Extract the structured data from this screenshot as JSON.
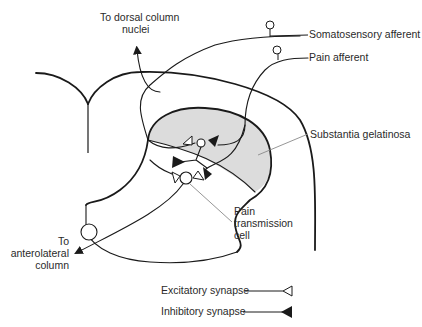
{
  "diagram": {
    "labels": {
      "dorsal_column_line1": "To dorsal column",
      "dorsal_column_line2": "nuclei",
      "somatosensory_afferent": "Somatosensory afferent",
      "pain_afferent": "Pain afferent",
      "substantia_gelatinosa": "Substantia gelatinosa",
      "pain_transmission_line1": "Pain",
      "pain_transmission_line2": "transmission",
      "pain_transmission_line3": "cell",
      "anterolateral_line1": "To",
      "anterolateral_line2": "anterolateral",
      "anterolateral_line3": "column"
    },
    "legend": {
      "excitatory": "Excitatory synapse",
      "inhibitory": "Inhibitory synapse"
    },
    "colors": {
      "line": "#1a1a1a",
      "shading": "#dcdcdc",
      "leader": "#8a8a8a",
      "text": "#2a2a2a"
    }
  }
}
